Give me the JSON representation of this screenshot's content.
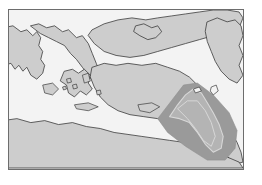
{
  "figure": {
    "kind": "reference-map",
    "region_title": "Eastern Mediterranean and Black Sea region",
    "has_frame": true,
    "labels": [],
    "annotations": []
  },
  "colors": {
    "sea": "#f3f3f3",
    "land": "#cdcdcd",
    "coastline": "#3a3a3a",
    "frame": "#6d6d6d",
    "highlight_band": "#9a9a9a",
    "highlight_band_edge": "#8d8d8d",
    "corridor_fill": "#b4b4b4",
    "corridor_outline": "#d8d8d8",
    "page_background": "#ffffff"
  },
  "map": {
    "viewbox": "0 0 236 161",
    "features": {
      "landmasses": [
        {
          "name": "italy-balkans-west",
          "path": "M -6 18 L 4 16 L 12 22 L 18 20 L 24 26 L 28 22 L 32 28 L 30 36 L 34 42 L 32 50 L 36 56 L 34 64 L 28 70 L 22 66 L 18 58 L 14 62 L 10 56 L 6 60 L 2 54 L -6 56 Z"
        },
        {
          "name": "italian-peninsula",
          "path": "M 22 16 L 30 14 L 38 18 L 46 16 L 54 22 L 60 20 L 68 28 L 74 26 L 80 34 L 84 44 L 88 54 L 92 64 L 96 72 L 92 78 L 86 74 L 80 66 L 74 58 L 68 50 L 62 44 L 56 36 L 48 32 L 40 28 L 32 24 Z"
        },
        {
          "name": "greece-aegean-mainland",
          "path": "M 56 62 L 64 60 L 70 64 L 76 60 L 82 66 L 80 74 L 84 80 L 78 86 L 72 82 L 66 88 L 60 84 L 58 76 L 52 72 Z"
        },
        {
          "name": "anatolia-turkey",
          "path": "M 84 58 L 96 54 L 108 56 L 120 54 L 134 56 L 148 54 L 160 58 L 172 62 L 182 68 L 190 76 L 196 86 L 200 96 L 198 106 L 190 112 L 178 114 L 164 112 L 150 110 L 136 108 L 122 106 L 110 102 L 100 96 L 92 88 L 86 78 L 82 68 Z"
        },
        {
          "name": "black-sea-north-shore",
          "path": "M 84 20 L 96 14 L 110 10 L 124 8 L 138 10 L 150 8 L 164 6 L 178 4 L 192 2 L 206 0 L 220 0 L 232 2 L 236 8 L 232 18 L 220 22 L 206 26 L 192 30 L 178 34 L 164 38 L 150 42 L 136 46 L 122 48 L 108 46 L 96 42 L 86 34 L 80 26 Z"
        },
        {
          "name": "crimea-peninsula",
          "path": "M 128 16 L 136 14 L 144 18 L 150 16 L 154 22 L 148 28 L 140 30 L 132 26 L 126 22 Z"
        },
        {
          "name": "caucasus-caspian-east",
          "path": "M 200 12 L 210 8 L 220 12 L 228 10 L 234 16 L 236 26 L 232 36 L 236 46 L 232 56 L 236 66 L 230 74 L 222 70 L 214 62 L 208 52 L 204 42 L 200 32 L 198 22 Z"
        },
        {
          "name": "levant-coast",
          "path": "M 196 104 L 204 100 L 212 106 L 218 114 L 224 124 L 230 134 L 234 144 L 236 154 L 228 156 L 220 148 L 214 138 L 208 128 L 202 118 L 198 112 Z"
        },
        {
          "name": "north-africa-coast",
          "path": "M -6 112 L 8 110 L 22 114 L 36 112 L 50 116 L 64 114 L 78 118 L 92 120 L 106 124 L 120 126 L 134 128 L 148 130 L 162 132 L 176 134 L 190 138 L 204 142 L 218 148 L 232 154 L 236 160 L -6 160 Z"
        }
      ],
      "islands": [
        {
          "name": "sicily",
          "path": "M 34 76 L 44 74 L 50 80 L 44 86 L 36 84 Z"
        },
        {
          "name": "crete",
          "path": "M 66 96 L 80 94 L 90 98 L 80 102 L 68 100 Z"
        },
        {
          "name": "cyprus",
          "path": "M 130 96 L 144 94 L 152 98 L 142 104 L 132 102 Z"
        },
        {
          "name": "euboea",
          "path": "M 74 66 L 80 64 L 82 72 L 76 74 Z"
        },
        {
          "name": "aegean-island-a",
          "path": "M 58 70 L 62 69 L 63 73 L 59 74 Z"
        },
        {
          "name": "aegean-island-b",
          "path": "M 64 76 L 68 75 L 69 79 L 65 80 Z"
        },
        {
          "name": "aegean-island-c",
          "path": "M 54 78 L 57 77 L 58 80 L 55 81 Z"
        },
        {
          "name": "rhodes",
          "path": "M 88 82 L 92 81 L 93 85 L 89 86 Z"
        },
        {
          "name": "lake-van",
          "path": "M 186 80 L 192 78 L 194 82 L 188 84 Z"
        },
        {
          "name": "lake-urmia",
          "path": "M 204 78 L 209 76 L 211 82 L 206 86 L 203 82 Z"
        }
      ],
      "highlight_corridor": {
        "name": "mesopotamia-corridor-band",
        "description": "diagonal shaded band running from northwest to southeast",
        "band_path": "M 150 110 L 176 76 L 190 74 L 206 86 L 222 104 L 230 122 L 228 140 L 218 152 L 200 152 L 178 138 L 160 124 Z",
        "river_outline_paths": [
          "M 162 108 L 170 96 L 178 86 L 186 80 L 194 84 L 200 94 L 206 104 L 212 116 L 216 128 L 214 140 L 206 144 L 198 136 L 190 124 L 182 114 L 172 110 Z",
          "M 170 100 L 180 92 L 190 92 L 198 102 L 204 114 L 208 128 L 204 138 L 196 132 L 188 120 L 180 110 Z"
        ]
      }
    }
  }
}
